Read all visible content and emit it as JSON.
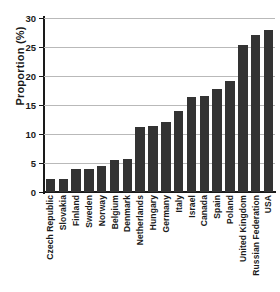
{
  "chart_data": {
    "type": "bar",
    "title": "",
    "xlabel": "",
    "ylabel": "Proportion (%)",
    "ylim": [
      0,
      30
    ],
    "yticks": [
      0,
      5,
      10,
      15,
      20,
      25,
      30
    ],
    "ytick_labels": [
      "0",
      "5",
      "10",
      "15",
      "20",
      "25",
      "30"
    ],
    "grid": true,
    "legend": "none",
    "bar_color": "#333333",
    "grid_color": "#b9b9b9",
    "axis_color": "#1a1a1a",
    "categories": [
      "Czech Republic",
      "Slovakia",
      "Finland",
      "Sweden",
      "Norway",
      "Belgium",
      "Denmark",
      "Netherlands",
      "Hungary",
      "Germany",
      "Italy",
      "Israel",
      "Canada",
      "Spain",
      "Poland",
      "United Kingdom",
      "Russian Federation",
      "USA"
    ],
    "values": [
      2.3,
      2.3,
      3.9,
      3.9,
      4.5,
      5.6,
      5.7,
      11.2,
      11.4,
      12.1,
      13.9,
      16.3,
      16.5,
      17.8,
      19.1,
      25.4,
      27.0,
      28.0
    ]
  }
}
